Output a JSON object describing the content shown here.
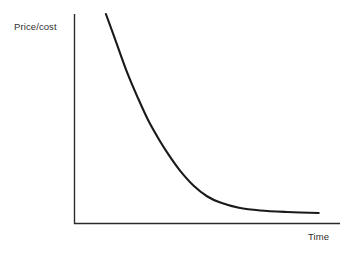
{
  "chart_data": {
    "type": "line",
    "title": "",
    "subtitle": "",
    "xlabel": "Time",
    "ylabel": "Price/cost",
    "grid": false,
    "legend": null,
    "legend_position": "none",
    "annotations": [],
    "xticklabels": [],
    "yticklabels": [],
    "xlim": [
      0,
      1
    ],
    "ylim": [
      0,
      1
    ],
    "series": [
      {
        "name": "Price/cost over time",
        "color": "#1a1a1a",
        "x": [
          0.12,
          0.16,
          0.2,
          0.24,
          0.28,
          0.32,
          0.36,
          0.4,
          0.45,
          0.5,
          0.55,
          0.62,
          0.7,
          0.8,
          0.92
        ],
        "values": [
          1.0,
          0.86,
          0.72,
          0.6,
          0.49,
          0.4,
          0.32,
          0.25,
          0.18,
          0.13,
          0.1,
          0.075,
          0.062,
          0.055,
          0.05
        ]
      }
    ]
  },
  "style": {
    "background": "#ffffff",
    "axis_color": "#2b2b2b",
    "curve_color": "#1a1a1a",
    "text_color": "#2f2f2f"
  },
  "axes": {
    "y_axis_name": "y-axis-line",
    "x_axis_name": "x-axis-line"
  }
}
